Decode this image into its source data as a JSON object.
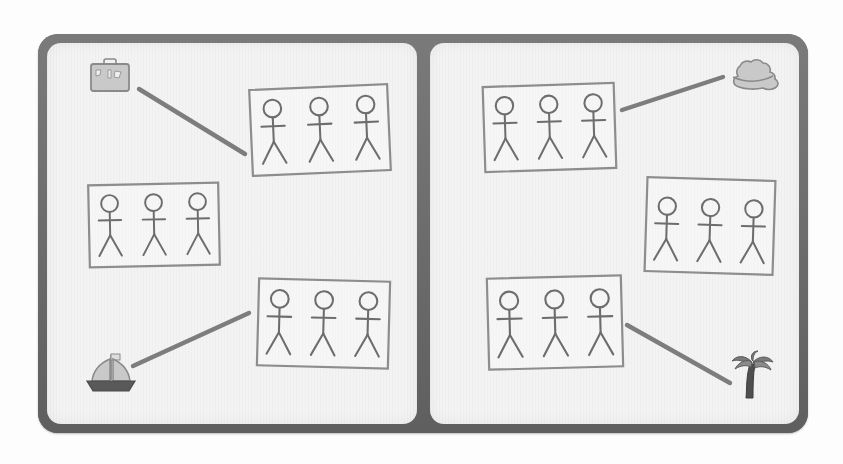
{
  "scene": {
    "title": "Picture matching worksheet",
    "description": "Two-page spread with stick-figure photo cards connected by lines to travel icons",
    "colors": {
      "page_background": "#ffffff",
      "frame": "#6f6f6f",
      "panel": "#f3f3f3",
      "card_border": "#8d8d8d",
      "figure_stroke": "#6d6d6d",
      "connector": "#7d7d7d",
      "icon_fill": "#c9c9c9",
      "icon_stroke": "#8a8a8a",
      "boat_hull": "#595959",
      "palm_trunk": "#4f4f4f"
    },
    "panels": [
      {
        "name": "left-page",
        "cards": [
          {
            "id": "card-top-left-page",
            "figures": 3,
            "x": 250,
            "y": 86,
            "w": 140,
            "h": 88,
            "rotate": -2.5
          },
          {
            "id": "card-middle-left-page",
            "figures": 3,
            "x": 88,
            "y": 183,
            "w": 132,
            "h": 84,
            "rotate": -1.2
          },
          {
            "id": "card-bottom-left-page",
            "figures": 3,
            "x": 257,
            "y": 279,
            "w": 133,
            "h": 89,
            "rotate": 1.5
          }
        ],
        "icons": [
          {
            "id": "suitcase-icon",
            "label": "suitcase",
            "x": 86,
            "y": 56,
            "w": 48,
            "h": 40
          },
          {
            "id": "sailboat-icon",
            "label": "sailboat",
            "x": 84,
            "y": 352,
            "w": 54,
            "h": 42
          }
        ],
        "connectors": [
          {
            "id": "connector-suitcase-to-card",
            "from": "suitcase-icon",
            "to": "card-top-left-page",
            "x1": 139,
            "y1": 89,
            "x2": 245,
            "y2": 154
          },
          {
            "id": "connector-sailboat-to-card",
            "from": "sailboat-icon",
            "to": "card-bottom-left-page",
            "x1": 133,
            "y1": 366,
            "x2": 249,
            "y2": 313
          }
        ]
      },
      {
        "name": "right-page",
        "cards": [
          {
            "id": "card-top-right-page",
            "figures": 3,
            "x": 483,
            "y": 84,
            "w": 133,
            "h": 87,
            "rotate": -1.8
          },
          {
            "id": "card-middle-right-page",
            "figures": 3,
            "x": 645,
            "y": 178,
            "w": 130,
            "h": 96,
            "rotate": 1.8
          },
          {
            "id": "card-bottom-right-page",
            "figures": 3,
            "x": 487,
            "y": 276,
            "w": 136,
            "h": 93,
            "rotate": -1.5
          }
        ],
        "icons": [
          {
            "id": "cloud-icon",
            "label": "cloud",
            "x": 726,
            "y": 56,
            "w": 54,
            "h": 36
          },
          {
            "id": "palm-tree-icon",
            "label": "palm tree",
            "x": 728,
            "y": 350,
            "w": 48,
            "h": 50
          }
        ],
        "connectors": [
          {
            "id": "connector-card-to-cloud",
            "from": "card-top-right-page",
            "to": "cloud-icon",
            "x1": 622,
            "y1": 110,
            "x2": 723,
            "y2": 77
          },
          {
            "id": "connector-card-to-palm",
            "from": "card-bottom-right-page",
            "to": "palm-tree-icon",
            "x1": 627,
            "y1": 325,
            "x2": 730,
            "y2": 383
          }
        ]
      }
    ]
  }
}
